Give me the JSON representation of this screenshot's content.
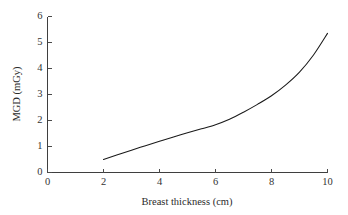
{
  "chart_data": {
    "type": "line",
    "title": "",
    "subtitle": "",
    "xlabel": "Breast thickness (cm)",
    "ylabel": "MGD (mGy)",
    "xlim": [
      0,
      10
    ],
    "ylim": [
      0,
      6
    ],
    "xticks": [
      0,
      2,
      4,
      6,
      8,
      10
    ],
    "yticks": [
      0,
      1,
      2,
      3,
      4,
      5,
      6
    ],
    "xtick_labels": [
      "0",
      "2",
      "4",
      "6",
      "8",
      "10"
    ],
    "ytick_labels": [
      "0",
      "1",
      "2",
      "3",
      "4",
      "5",
      "6"
    ],
    "grid": false,
    "legend": null,
    "legend_position": "none",
    "annotations": [],
    "series": [
      {
        "name": "MGD vs breast thickness",
        "color": "#1a1a1a",
        "x": [
          2.0,
          2.5,
          3.0,
          3.5,
          4.0,
          4.5,
          5.0,
          5.5,
          6.0,
          6.5,
          7.0,
          7.5,
          8.0,
          8.5,
          9.0,
          9.5,
          10.0
        ],
        "values": [
          0.5,
          0.68,
          0.86,
          1.03,
          1.2,
          1.37,
          1.53,
          1.68,
          1.84,
          2.05,
          2.32,
          2.62,
          2.95,
          3.36,
          3.86,
          4.52,
          5.35
        ]
      }
    ]
  },
  "axis": {
    "x_title": "Breast thickness (cm)",
    "y_title": "MGD (mGy)"
  },
  "colors": {
    "curve": "#1a1a1a",
    "axis": "#3f3f3f",
    "text": "#333333",
    "background": "#ffffff"
  }
}
